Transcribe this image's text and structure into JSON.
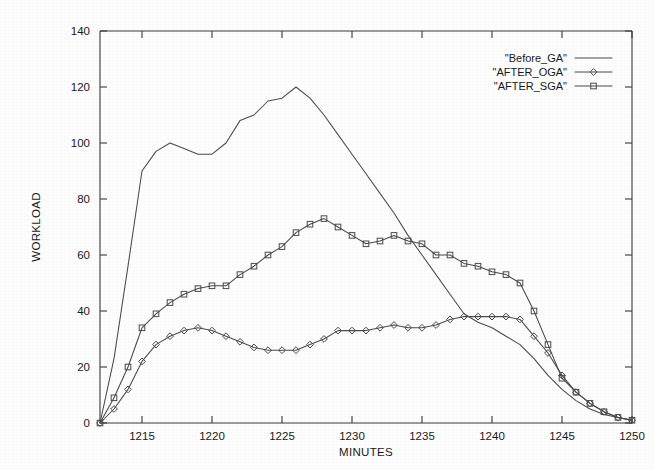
{
  "chart_data": {
    "type": "line",
    "title": "",
    "xlabel": "MINUTES",
    "ylabel": "WORKLOAD",
    "xlim": [
      1212,
      1250
    ],
    "ylim": [
      0,
      140
    ],
    "xticks": [
      1215,
      1220,
      1225,
      1230,
      1235,
      1240,
      1245,
      1250
    ],
    "yticks": [
      0,
      20,
      40,
      60,
      80,
      100,
      120,
      140
    ],
    "grid": false,
    "legend_position": "top-right",
    "x": [
      1212,
      1213,
      1214,
      1215,
      1216,
      1217,
      1218,
      1219,
      1220,
      1221,
      1222,
      1223,
      1224,
      1225,
      1226,
      1227,
      1228,
      1229,
      1230,
      1231,
      1232,
      1233,
      1234,
      1235,
      1236,
      1237,
      1238,
      1239,
      1240,
      1241,
      1242,
      1243,
      1244,
      1245,
      1246,
      1247,
      1248,
      1249,
      1250
    ],
    "series": [
      {
        "name": "\"Before_GA\"",
        "marker": "none",
        "values": [
          0,
          23,
          56,
          90,
          97,
          100,
          98,
          96,
          96,
          100,
          108,
          110,
          115,
          116,
          120,
          116,
          110,
          103,
          96,
          89,
          82,
          75,
          67,
          60,
          53,
          46,
          39,
          36,
          34,
          31,
          28,
          23,
          17,
          12,
          8,
          5,
          3,
          2,
          1
        ]
      },
      {
        "name": "\"AFTER_OGA\"",
        "marker": "diamond",
        "values": [
          0,
          5,
          12,
          22,
          28,
          31,
          33,
          34,
          33,
          31,
          29,
          27,
          26,
          26,
          26,
          28,
          30,
          33,
          33,
          33,
          34,
          35,
          34,
          34,
          35,
          37,
          38,
          38,
          38,
          38,
          37,
          31,
          25,
          17,
          11,
          7,
          4,
          2,
          1
        ]
      },
      {
        "name": "\"AFTER_SGA\"",
        "marker": "square",
        "values": [
          0,
          9,
          20,
          34,
          39,
          43,
          46,
          48,
          49,
          49,
          53,
          56,
          60,
          63,
          68,
          71,
          73,
          70,
          67,
          64,
          65,
          67,
          65,
          64,
          60,
          60,
          57,
          56,
          54,
          53,
          50,
          40,
          28,
          16,
          11,
          7,
          4,
          2,
          1
        ]
      }
    ]
  },
  "legend": {
    "entries": [
      {
        "label": "\"Before_GA\"",
        "marker": "none"
      },
      {
        "label": "\"AFTER_OGA\"",
        "marker": "diamond"
      },
      {
        "label": "\"AFTER_SGA\"",
        "marker": "square"
      }
    ]
  },
  "colors": {
    "background": "#fdfdfd",
    "axis": "#3a3a3a",
    "line": "#4a4a4a",
    "text": "#1a1a1a"
  }
}
